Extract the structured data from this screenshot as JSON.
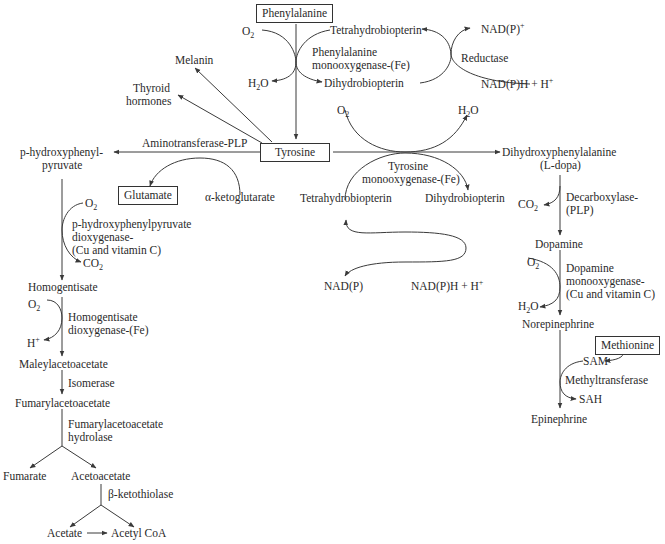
{
  "diagram": {
    "nodes": {
      "phenylalanine": "Phenylalanine",
      "tyrosine": "Tyrosine",
      "glutamate": "Glutamate",
      "methionine": "Methionine",
      "melanin": "Melanin",
      "thyroid_1": "Thyroid",
      "thyroid_2": "hormones",
      "phpp_1": "p-hydroxyphenyl-",
      "phpp_2": "pyruvate",
      "alpha_kg": "α-ketoglutarate",
      "homogentisate": "Homogentisate",
      "maleylacetoacetate": "Maleylacetoacetate",
      "fumarylacetoacetate": "Fumarylacetoacetate",
      "fumarate": "Fumarate",
      "acetoacetate": "Acetoacetate",
      "acetate": "Acetate",
      "acetyl_coa": "Acetyl CoA",
      "ldopa_1": "Dihydroxyphenylalanine",
      "ldopa_2": "(L-dopa)",
      "dopamine": "Dopamine",
      "norepinephrine": "Norepinephrine",
      "epinephrine": "Epinephrine",
      "sam": "SAM",
      "sah": "SAH"
    },
    "cofactors": {
      "tetrahydrobiopterin_top": "Tetrahydrobiopterin",
      "dihydrobiopterin_top": "Dihydrobiopterin",
      "nadp_plus": "NAD(P)",
      "nadph_top": "NAD(P)H + H",
      "tetrahydrobiopterin_mid": "Tetrahydrobiopterin",
      "dihydrobiopterin_mid": "Dihydrobiopterin",
      "nadp_mid": "NAD(P)",
      "nadph_mid": "NAD(P)H + H",
      "o2": "O",
      "h2o_h": "H",
      "h2o_o": "O",
      "co2_c": "CO",
      "h_plus": "H",
      "two": "2",
      "plus": "+"
    },
    "enzymes": {
      "phe_mono_1": "Phenylalanine",
      "phe_mono_2": "monooxygenase-(Fe)",
      "reductase": "Reductase",
      "aminotransferase": "Aminotransferase-PLP",
      "tyr_mono_1": "Tyrosine",
      "tyr_mono_2": "monooxygenase-(Fe)",
      "phpp_diox_1": "p-hydroxyphenylpyruvate",
      "phpp_diox_2": "dioxygenase-",
      "phpp_diox_3": "(Cu and vitamin C)",
      "hg_diox_1": "Homogentisate",
      "hg_diox_2": "dioxygenase-(Fe)",
      "isomerase": "Isomerase",
      "faa_hyd_1": "Fumarylacetoacetate",
      "faa_hyd_2": "hydrolase",
      "ketothiolase": "β-ketothiolase",
      "decarb_1": "Decarboxylase-",
      "decarb_2": "(PLP)",
      "dbh_1": "Dopamine",
      "dbh_2": "monooxygenase-",
      "dbh_3": "(Cu and vitamin C)",
      "methyltransferase": "Methyltransferase"
    },
    "colors": {
      "line": "#3a3a3a",
      "text": "#2a2a2a",
      "background": "#ffffff"
    }
  }
}
